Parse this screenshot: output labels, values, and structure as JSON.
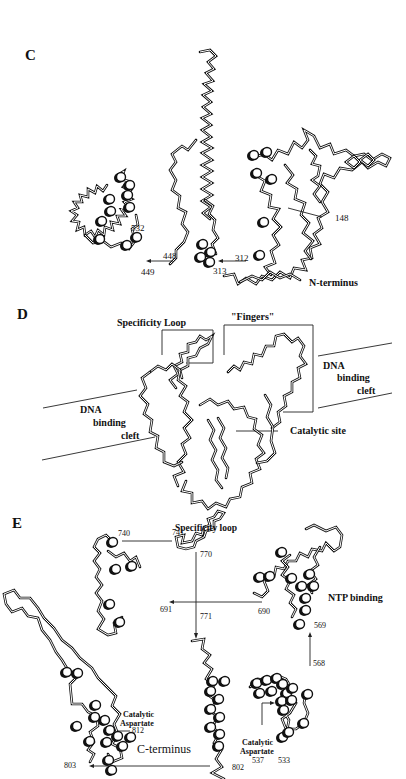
{
  "figure": {
    "panels": [
      {
        "id": "C",
        "letter": "C",
        "labels": {
          "r532": "532",
          "r449": "449",
          "r448": "448",
          "r313": "313",
          "r312": "312",
          "r148": "148",
          "n_terminus": "N-terminus"
        }
      },
      {
        "id": "D",
        "letter": "D",
        "labels": {
          "specificity_loop": "Specificity Loop",
          "fingers": "\"Fingers\"",
          "dna_cleft_right": [
            "DNA",
            "binding",
            "cleft"
          ],
          "dna_cleft_left": [
            "DNA",
            "binding",
            "cleft"
          ],
          "catalytic_site": "Catalytic site"
        }
      },
      {
        "id": "E",
        "letter": "E",
        "labels": {
          "specificity_loop": "Specificity loop",
          "r740": "740",
          "r741": "741",
          "r770": "770",
          "r771": "771",
          "r691": "691",
          "r690": "690",
          "ntp_binding": "NTP binding",
          "r569": "569",
          "r568": "568",
          "catalytic_aspartate_812": [
            "Catalytic",
            "Aspartate"
          ],
          "r812": "812",
          "c_terminus": "C-terminus",
          "r803": "803",
          "r802": "802",
          "catalytic_aspartate_537": [
            "Catalytic",
            "Aspartate",
            "537"
          ],
          "r533": "533"
        }
      }
    ]
  }
}
